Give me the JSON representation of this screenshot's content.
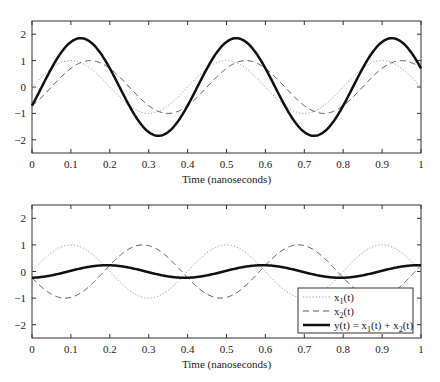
{
  "chart_data": [
    {
      "type": "line",
      "panel": "top",
      "title": "",
      "xlabel": "Time (nanoseconds)",
      "ylabel": "",
      "xlim": [
        0,
        1
      ],
      "ylim": [
        -2.5,
        2.5
      ],
      "xticks": [
        0,
        0.1,
        0.2,
        0.3,
        0.4,
        0.5,
        0.6,
        0.7,
        0.8,
        0.9,
        1
      ],
      "xtick_labels": [
        "0",
        "0.1",
        "0.2",
        "0.3",
        "0.4",
        "0.5",
        "0.6",
        "0.7",
        "0.8",
        "0.9",
        "1"
      ],
      "yticks": [
        -2,
        -1,
        0,
        1,
        2
      ],
      "ytick_labels": [
        "−2",
        "−1",
        "0",
        "1",
        "2"
      ],
      "grid": false,
      "legend": null,
      "frequency_ghz": 2.5,
      "series": [
        {
          "name": "x1(t)",
          "style": "dotted",
          "color": "#9a9a9a",
          "amplitude": 1,
          "phase_rad": 0.0,
          "x": [
            0,
            0.05,
            0.1,
            0.15,
            0.2,
            0.25,
            0.3,
            0.35,
            0.4,
            0.45,
            0.5,
            0.55,
            0.6,
            0.65,
            0.7,
            0.75,
            0.8,
            0.85,
            0.9,
            0.95,
            1
          ],
          "values": [
            0,
            0.71,
            1,
            0.71,
            0,
            -0.71,
            -1,
            -0.71,
            0,
            0.71,
            1,
            0.71,
            0,
            -0.71,
            -1,
            -0.71,
            0,
            0.71,
            1,
            0.71,
            0
          ]
        },
        {
          "name": "x2(t)",
          "style": "dashed",
          "color": "#555555",
          "amplitude": 1,
          "phase_rad": -0.785,
          "x": [
            0,
            0.05,
            0.1,
            0.15,
            0.2,
            0.25,
            0.3,
            0.35,
            0.4,
            0.45,
            0.5,
            0.55,
            0.6,
            0.65,
            0.7,
            0.75,
            0.8,
            0.85,
            0.9,
            0.95,
            1
          ],
          "values": [
            -0.71,
            0,
            0.71,
            1,
            0.71,
            0,
            -0.71,
            -1,
            -0.71,
            0,
            0.71,
            1,
            0.71,
            0,
            -0.71,
            -1,
            -0.71,
            0,
            0.71,
            1,
            0.71
          ]
        },
        {
          "name": "y(t) = x1(t) + x2(t)",
          "style": "solid-thick",
          "color": "#111111",
          "amplitude": 1.85,
          "phase_rad": -0.393,
          "x": [
            0,
            0.05,
            0.1,
            0.15,
            0.2,
            0.25,
            0.3,
            0.35,
            0.4,
            0.45,
            0.5,
            0.55,
            0.6,
            0.65,
            0.7,
            0.75,
            0.8,
            0.85,
            0.9,
            0.95,
            1
          ],
          "values": [
            -0.71,
            0.71,
            1.71,
            1.71,
            0.71,
            -0.71,
            -1.71,
            -1.71,
            -0.71,
            0.71,
            1.71,
            1.71,
            0.71,
            -0.71,
            -1.71,
            -1.71,
            -0.71,
            0.71,
            1.71,
            1.71,
            0.71
          ]
        }
      ]
    },
    {
      "type": "line",
      "panel": "bottom",
      "title": "",
      "xlabel": "Time (nanoseconds)",
      "ylabel": "",
      "xlim": [
        0,
        1
      ],
      "ylim": [
        -2.5,
        2.5
      ],
      "xticks": [
        0,
        0.1,
        0.2,
        0.3,
        0.4,
        0.5,
        0.6,
        0.7,
        0.8,
        0.9,
        1
      ],
      "xtick_labels": [
        "0",
        "0.1",
        "0.2",
        "0.3",
        "0.4",
        "0.5",
        "0.6",
        "0.7",
        "0.8",
        "0.9",
        "1"
      ],
      "yticks": [
        -2,
        -1,
        0,
        1,
        2
      ],
      "ytick_labels": [
        "−2",
        "−1",
        "0",
        "1",
        "2"
      ],
      "grid": false,
      "legend": "bottom-right",
      "frequency_ghz": 2.5,
      "series": [
        {
          "name": "x1(t)",
          "style": "dotted",
          "color": "#9a9a9a",
          "amplitude": 1,
          "phase_rad": 0.0,
          "x": [
            0,
            0.05,
            0.1,
            0.15,
            0.2,
            0.25,
            0.3,
            0.35,
            0.4,
            0.45,
            0.5,
            0.55,
            0.6,
            0.65,
            0.7,
            0.75,
            0.8,
            0.85,
            0.9,
            0.95,
            1
          ],
          "values": [
            0,
            0.71,
            1,
            0.71,
            0,
            -0.71,
            -1,
            -0.71,
            0,
            0.71,
            1,
            0.71,
            0,
            -0.71,
            -1,
            -0.71,
            0,
            0.71,
            1,
            0.71,
            0
          ]
        },
        {
          "name": "x2(t)",
          "style": "dashed",
          "color": "#555555",
          "amplitude": -1,
          "phase_rad": 0.236,
          "x": [
            0,
            0.05,
            0.1,
            0.15,
            0.2,
            0.25,
            0.3,
            0.35,
            0.4,
            0.45,
            0.5,
            0.55,
            0.6,
            0.65,
            0.7,
            0.75,
            0.8,
            0.85,
            0.9,
            0.95,
            1
          ],
          "values": [
            -0.23,
            -0.87,
            -0.97,
            -0.54,
            0.23,
            0.87,
            0.97,
            0.54,
            -0.23,
            -0.87,
            -0.97,
            -0.54,
            0.23,
            0.87,
            0.97,
            0.54,
            -0.23,
            -0.87,
            -0.97,
            -0.54,
            0.23
          ]
        },
        {
          "name": "y(t) = x1(t) + x2(t)",
          "style": "solid-thick",
          "color": "#111111",
          "amplitude": 0.24,
          "phase_rad": -1.453,
          "x": [
            0,
            0.05,
            0.1,
            0.15,
            0.2,
            0.25,
            0.3,
            0.35,
            0.4,
            0.45,
            0.5,
            0.55,
            0.6,
            0.65,
            0.7,
            0.75,
            0.8,
            0.85,
            0.9,
            0.95,
            1
          ],
          "values": [
            -0.23,
            -0.16,
            0.03,
            0.17,
            0.23,
            0.16,
            -0.03,
            -0.17,
            -0.23,
            -0.16,
            0.03,
            0.17,
            0.23,
            0.16,
            -0.03,
            -0.17,
            -0.23,
            -0.16,
            0.03,
            0.17,
            0.23
          ]
        }
      ]
    }
  ],
  "legend": {
    "items": [
      {
        "label_main": "x",
        "label_sub": "1",
        "label_rest": "(t)",
        "style": "dotted"
      },
      {
        "label_main": "x",
        "label_sub": "2",
        "label_rest": "(t)",
        "style": "dashed"
      },
      {
        "label_full": "y(t) = x1(t) + x2(t)",
        "style": "solid-thick"
      }
    ]
  }
}
